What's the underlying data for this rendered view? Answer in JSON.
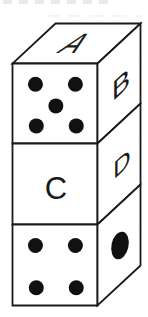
{
  "figure": {
    "background_color": "#ffffff",
    "line_color": "#1a1a1a",
    "pip_color": "#111111",
    "dice": [
      {
        "position": "top",
        "top_face": {
          "type": "letter",
          "label": "A"
        },
        "front_face": {
          "type": "pips",
          "count": 5
        },
        "right_face": {
          "type": "letter",
          "label": "B"
        }
      },
      {
        "position": "middle",
        "front_face": {
          "type": "letter",
          "label": "C"
        },
        "right_face": {
          "type": "letter",
          "label": "D"
        }
      },
      {
        "position": "bottom",
        "front_face": {
          "type": "pips",
          "count": 4
        },
        "right_face": {
          "type": "pips",
          "count": 1
        }
      }
    ]
  }
}
